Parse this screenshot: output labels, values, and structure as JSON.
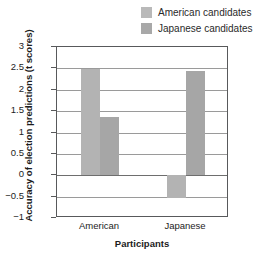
{
  "chart_data": {
    "type": "bar",
    "title": "",
    "xlabel": "Participants",
    "ylabel": "Accuracy of election predictions (t scores)",
    "categories": [
      "American",
      "Japanese"
    ],
    "series": [
      {
        "name": "American candidates",
        "values": [
          2.48,
          -0.54
        ],
        "color": "#b3b3b3"
      },
      {
        "name": "Japanese candidates",
        "values": [
          1.37,
          2.43
        ],
        "color": "#a6a6a6"
      }
    ],
    "ylim": [
      -1,
      3
    ],
    "ytick_labels": [
      "3",
      "2.5",
      "2",
      "1.5",
      "1",
      "0.5",
      "0",
      "-0.5",
      "-1"
    ],
    "ytick_values": [
      3,
      2.5,
      2,
      1.5,
      1,
      0.5,
      0,
      -0.5,
      -1
    ],
    "grid": true,
    "legend_position": "top-right",
    "zero_reference": 0
  },
  "legend": {
    "items": [
      {
        "label": "American candidates",
        "swatch": "#b9b9b9"
      },
      {
        "label": "Japanese candidates",
        "swatch": "#a8a8a8"
      }
    ]
  },
  "axes": {
    "ylabel": "Accuracy of election predictions (t scores)",
    "xlabel": "Participants"
  },
  "colors": {
    "frame": "#58595b",
    "grid": "#9a9a9a",
    "text": "#1c1c1c",
    "background": "#ffffff"
  }
}
